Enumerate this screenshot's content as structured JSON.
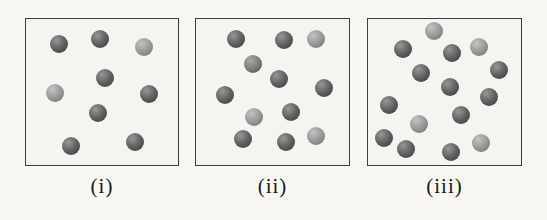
{
  "figure": {
    "background_color": "#f8f7f4",
    "box_border_color": "#3d3d3d",
    "box_background_color": "#f5f4f1",
    "label_color": "#1a1a1a",
    "sphere_diameter_px": 18,
    "shade_colors": {
      "dark": {
        "highlight": "#979797",
        "body": "#5e5e5e",
        "rim": "#373737"
      },
      "medium": {
        "highlight": "#a8a8a8",
        "body": "#7b7b7b",
        "rim": "#4e4e4e"
      },
      "light": {
        "highlight": "#c3c3c3",
        "body": "#979797",
        "rim": "#6a6a6a"
      }
    },
    "boxes": [
      {
        "label": "(i)",
        "particle_count": 9,
        "frame": {
          "left": 25,
          "top": 18,
          "width": 154,
          "height": 148
        },
        "label_offset_y": 10,
        "spheres": [
          {
            "x": 33,
            "y": 25,
            "shade": "dark"
          },
          {
            "x": 74,
            "y": 20,
            "shade": "dark"
          },
          {
            "x": 118,
            "y": 28,
            "shade": "light"
          },
          {
            "x": 79,
            "y": 59,
            "shade": "dark"
          },
          {
            "x": 29,
            "y": 74,
            "shade": "light"
          },
          {
            "x": 123,
            "y": 75,
            "shade": "dark"
          },
          {
            "x": 72,
            "y": 94,
            "shade": "dark"
          },
          {
            "x": 109,
            "y": 123,
            "shade": "dark"
          },
          {
            "x": 45,
            "y": 127,
            "shade": "dark"
          }
        ]
      },
      {
        "label": "(ii)",
        "particle_count": 12,
        "frame": {
          "left": 195,
          "top": 18,
          "width": 155,
          "height": 148
        },
        "label_offset_y": 10,
        "spheres": [
          {
            "x": 40,
            "y": 20,
            "shade": "dark"
          },
          {
            "x": 88,
            "y": 21,
            "shade": "dark"
          },
          {
            "x": 120,
            "y": 20,
            "shade": "light"
          },
          {
            "x": 57,
            "y": 45,
            "shade": "medium"
          },
          {
            "x": 83,
            "y": 60,
            "shade": "dark"
          },
          {
            "x": 128,
            "y": 69,
            "shade": "dark"
          },
          {
            "x": 29,
            "y": 76,
            "shade": "dark"
          },
          {
            "x": 95,
            "y": 93,
            "shade": "dark"
          },
          {
            "x": 58,
            "y": 98,
            "shade": "light"
          },
          {
            "x": 47,
            "y": 120,
            "shade": "dark"
          },
          {
            "x": 90,
            "y": 123,
            "shade": "dark"
          },
          {
            "x": 120,
            "y": 117,
            "shade": "light"
          }
        ]
      },
      {
        "label": "(iii)",
        "particle_count": 15,
        "frame": {
          "left": 367,
          "top": 18,
          "width": 155,
          "height": 148
        },
        "label_offset_y": 10,
        "spheres": [
          {
            "x": 66,
            "y": 12,
            "shade": "light"
          },
          {
            "x": 35,
            "y": 30,
            "shade": "dark"
          },
          {
            "x": 84,
            "y": 34,
            "shade": "dark"
          },
          {
            "x": 111,
            "y": 28,
            "shade": "light"
          },
          {
            "x": 131,
            "y": 51,
            "shade": "dark"
          },
          {
            "x": 53,
            "y": 54,
            "shade": "dark"
          },
          {
            "x": 82,
            "y": 68,
            "shade": "dark"
          },
          {
            "x": 121,
            "y": 78,
            "shade": "dark"
          },
          {
            "x": 21,
            "y": 86,
            "shade": "dark"
          },
          {
            "x": 93,
            "y": 96,
            "shade": "dark"
          },
          {
            "x": 51,
            "y": 105,
            "shade": "light"
          },
          {
            "x": 16,
            "y": 119,
            "shade": "dark"
          },
          {
            "x": 38,
            "y": 130,
            "shade": "dark"
          },
          {
            "x": 83,
            "y": 133,
            "shade": "dark"
          },
          {
            "x": 113,
            "y": 124,
            "shade": "light"
          }
        ]
      }
    ]
  }
}
